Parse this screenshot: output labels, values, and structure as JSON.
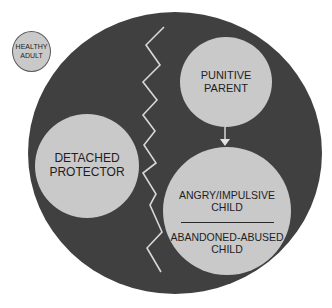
{
  "diagram": {
    "colors": {
      "background": "#ffffff",
      "outer_circle": "#404040",
      "mode_circle": "#c9c9c9",
      "text": "#1e1e1e",
      "line": "#d8d8d8"
    },
    "healthy_adult": {
      "line1": "HEALTHY",
      "line2": "ADULT"
    },
    "detached_protector": {
      "line1": "DETACHED",
      "line2": "PROTECTOR"
    },
    "punitive_parent": {
      "line1": "PUNITIVE",
      "line2": "PARENT"
    },
    "child_modes": {
      "upper": {
        "line1": "ANGRY/IMPULSIVE",
        "line2": "CHILD"
      },
      "lower": {
        "line1": "ABANDONED-ABUSED",
        "line2": "CHILD"
      }
    },
    "connectors": {
      "zigzag_divider": "jagged line separating detached protector from other modes",
      "arrow": "punitive parent to angry/impulsive child"
    }
  }
}
